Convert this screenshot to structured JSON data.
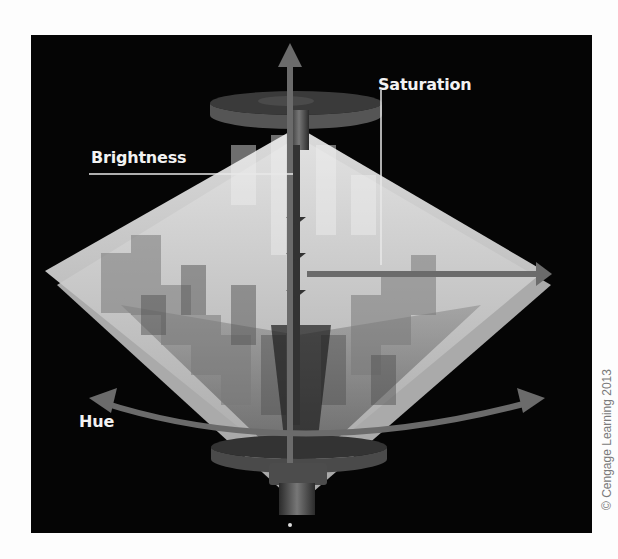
{
  "diagram": {
    "labels": {
      "saturation": "Saturation",
      "brightness": "Brightness",
      "hue": "Hue"
    },
    "copyright": "© Cengage Learning 2013",
    "colors": {
      "background": "#050505",
      "page": "#fdfdfd",
      "arrow": "#6b6b6b",
      "label_text": "#f2f2f2",
      "leader_line": "#e8e8e8"
    }
  }
}
